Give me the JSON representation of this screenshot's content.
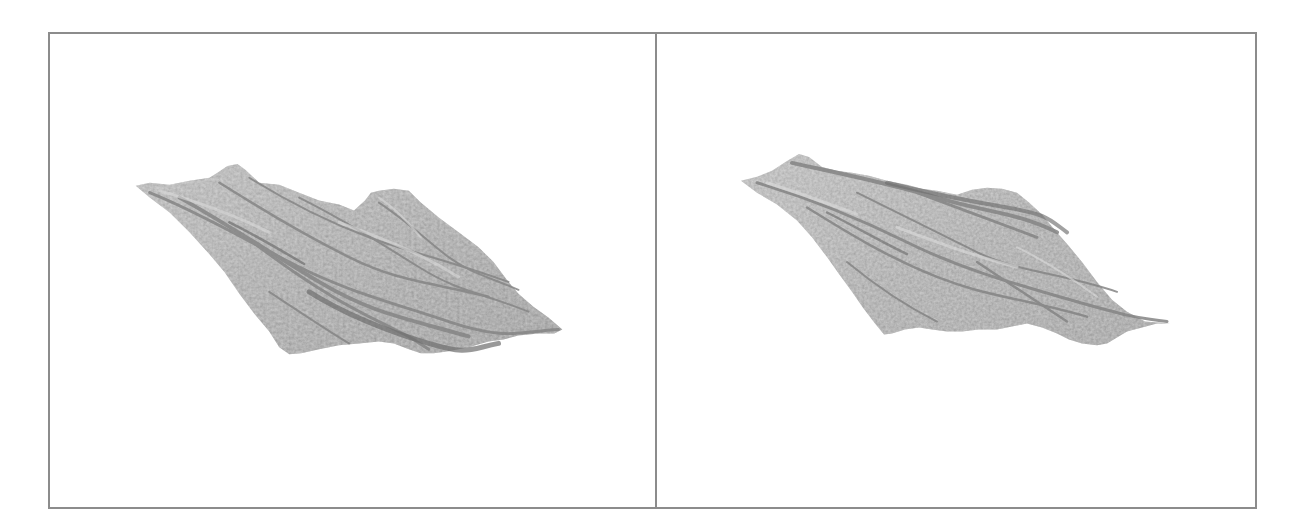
{
  "figure": {
    "panels": [
      {
        "id": "left",
        "content": "3D rendered fractal terrain surface (grayscale)",
        "tone": "#b4b4b4",
        "ridge": "#7a7a7a"
      },
      {
        "id": "right",
        "content": "3D rendered fractal terrain surface (grayscale)",
        "tone": "#b8b8b8",
        "ridge": "#7e7e7e"
      }
    ],
    "border_color": "#8c8c8c",
    "background": "#ffffff"
  }
}
